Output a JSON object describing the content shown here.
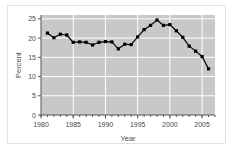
{
  "chart_data": {
    "type": "line",
    "title": "",
    "subtitle": "",
    "xlabel": "Year",
    "ylabel": "Percent",
    "xlim": [
      1980,
      2007
    ],
    "ylim": [
      0,
      26
    ],
    "grid": true,
    "legend": false,
    "legend_position": "none",
    "marker": "filled-square",
    "line_color": "#000000",
    "marker_color": "#000000",
    "plot_background": "#c8c8c8",
    "grid_color": "#ffffff",
    "figure_background": "#ffffff",
    "border_color": "#e2e2e2",
    "x_ticks_major": [
      1980,
      1985,
      1990,
      1995,
      2000,
      2005
    ],
    "x_tick_labels": [
      "1980",
      "1985",
      "1990",
      "1995",
      "2000",
      "2005"
    ],
    "x_ticks_minor_step": 1,
    "y_ticks": [
      0,
      5,
      10,
      15,
      20,
      25
    ],
    "y_tick_labels": [
      "0",
      "5",
      "10",
      "15",
      "20",
      "25"
    ],
    "x": [
      1981,
      1982,
      1983,
      1984,
      1985,
      1986,
      1987,
      1988,
      1989,
      1990,
      1991,
      1992,
      1993,
      1994,
      1995,
      1996,
      1997,
      1998,
      1999,
      2000,
      2001,
      2002,
      2003,
      2004,
      2005,
      2006
    ],
    "values": [
      21.3,
      20.1,
      21.0,
      20.8,
      18.9,
      19.0,
      18.9,
      18.2,
      18.9,
      19.1,
      19.0,
      17.2,
      18.4,
      18.3,
      20.3,
      22.2,
      23.3,
      24.7,
      23.3,
      23.5,
      21.9,
      20.2,
      17.9,
      16.6,
      15.2,
      12.0
    ],
    "categories": [
      "1981",
      "1982",
      "1983",
      "1984",
      "1985",
      "1986",
      "1987",
      "1988",
      "1989",
      "1990",
      "1991",
      "1992",
      "1993",
      "1994",
      "1995",
      "1996",
      "1997",
      "1998",
      "1999",
      "2000",
      "2001",
      "2002",
      "2003",
      "2004",
      "2005",
      "2006"
    ],
    "series": [
      {
        "name": "Percent",
        "values": [
          21.3,
          20.1,
          21.0,
          20.8,
          18.9,
          19.0,
          18.9,
          18.2,
          18.9,
          19.1,
          19.0,
          17.2,
          18.4,
          18.3,
          20.3,
          22.2,
          23.3,
          24.7,
          23.3,
          23.5,
          21.9,
          20.2,
          17.9,
          16.6,
          15.2,
          12.0
        ]
      }
    ],
    "annotations": []
  }
}
